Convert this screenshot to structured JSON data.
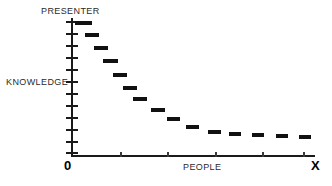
{
  "chart_data": {
    "type": "scatter",
    "title": "",
    "subtitle": "",
    "xlabel": "PEOPLE",
    "ylabel": "KNOWLEDGE",
    "ytop_label": "PRESENTER",
    "x_origin_label": "0",
    "x_end_label": "X",
    "grid": false,
    "legend": null,
    "xlim": [
      0,
      14
    ],
    "ylim": [
      0,
      12
    ],
    "axis_color": "#1a1a1a",
    "marker_color": "#111111",
    "label_color": "#2b2b2b",
    "background_color": "#ffffff",
    "marker_style": "horizontal-dash",
    "y_tick_count": 12,
    "x_tick_count": 5,
    "points": [
      {
        "index": 1,
        "x": 0.35,
        "y": 11.6,
        "px": 75,
        "py": 21,
        "w": 17
      },
      {
        "index": 2,
        "x": 1.25,
        "y": 10.2,
        "px": 85,
        "py": 33,
        "w": 14
      },
      {
        "index": 3,
        "x": 2.1,
        "y": 9.0,
        "px": 94,
        "py": 46,
        "w": 14
      },
      {
        "index": 4,
        "x": 2.95,
        "y": 7.8,
        "px": 103,
        "py": 59,
        "w": 15
      },
      {
        "index": 5,
        "x": 3.85,
        "y": 6.7,
        "px": 113,
        "py": 73,
        "w": 14
      },
      {
        "index": 6,
        "x": 4.75,
        "y": 5.7,
        "px": 123,
        "py": 86,
        "w": 14
      },
      {
        "index": 7,
        "x": 5.65,
        "y": 4.9,
        "px": 133,
        "py": 97,
        "w": 14
      },
      {
        "index": 8,
        "x": 6.7,
        "y": 4.2,
        "px": 151,
        "py": 108,
        "w": 14
      },
      {
        "index": 9,
        "x": 7.7,
        "y": 3.7,
        "px": 167,
        "py": 117,
        "w": 13
      },
      {
        "index": 10,
        "x": 8.7,
        "y": 3.3,
        "px": 186,
        "py": 125,
        "w": 13
      },
      {
        "index": 11,
        "x": 9.7,
        "y": 3.0,
        "px": 208,
        "py": 130,
        "w": 13
      },
      {
        "index": 12,
        "x": 10.6,
        "y": 2.9,
        "px": 229,
        "py": 132,
        "w": 12
      },
      {
        "index": 13,
        "x": 11.5,
        "y": 2.8,
        "px": 252,
        "py": 133,
        "w": 12
      },
      {
        "index": 14,
        "x": 12.4,
        "y": 2.8,
        "px": 276,
        "py": 134,
        "w": 12
      },
      {
        "index": 15,
        "x": 13.3,
        "y": 2.7,
        "px": 299,
        "py": 135,
        "w": 12
      }
    ],
    "y_ticks_px": [
      21,
      33,
      45,
      57,
      69,
      81,
      93,
      105,
      117,
      129,
      141,
      152
    ],
    "x_ticks_px": [
      120,
      167,
      215,
      262,
      303
    ]
  }
}
